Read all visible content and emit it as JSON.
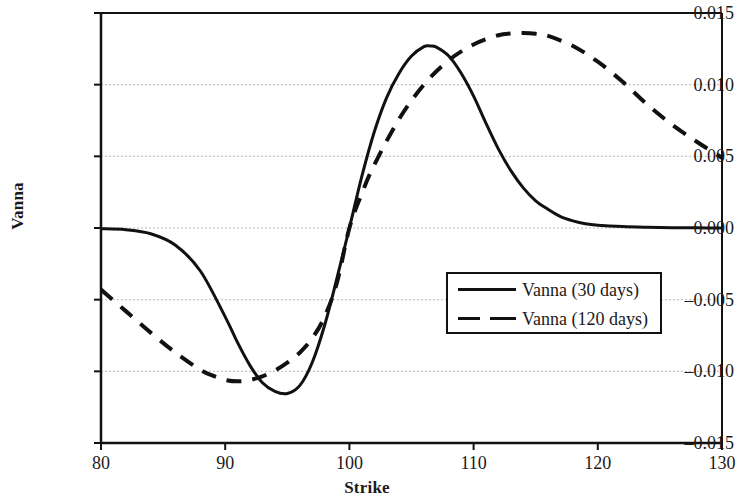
{
  "chart_data": {
    "type": "line",
    "title": "",
    "xlabel": "Strike",
    "ylabel": "Vanna",
    "xlim": [
      80,
      130
    ],
    "ylim": [
      -0.015,
      0.015
    ],
    "xticks": [
      "80",
      "90",
      "100",
      "110",
      "120",
      "130"
    ],
    "yticks": [
      "0.015",
      "0.010",
      "0.005",
      "0.000",
      "-0.005",
      "-0.010",
      "-0.015"
    ],
    "ytick_display": [
      "0.015",
      "0.010",
      "0.005",
      "0.000",
      "–0.005",
      "–0.010",
      "–0.015"
    ],
    "grid": "horizontal-dotted",
    "legend_position": "center-right",
    "series": [
      {
        "name": "Vanna (30 days)",
        "style": "solid",
        "color": "#111111",
        "x": [
          80,
          82,
          84,
          86,
          88,
          90,
          91,
          92,
          93,
          94,
          95,
          96,
          97,
          98,
          99,
          100,
          101,
          102,
          103,
          104,
          105,
          106,
          106.5,
          107,
          108,
          109,
          110,
          111,
          112,
          113,
          114,
          115,
          116,
          117,
          118,
          119,
          120,
          122,
          124,
          126,
          128,
          130
        ],
        "y": [
          -5e-05,
          -0.00012,
          -0.0004,
          -0.0012,
          -0.003,
          -0.0062,
          -0.008,
          -0.0096,
          -0.0108,
          -0.0114,
          -0.01155,
          -0.011,
          -0.0094,
          -0.0068,
          -0.0035,
          0.0,
          0.0036,
          0.0067,
          0.0091,
          0.0108,
          0.012,
          0.01265,
          0.0127,
          0.01262,
          0.012,
          0.0108,
          0.0092,
          0.0073,
          0.0055,
          0.004,
          0.0028,
          0.0019,
          0.0013,
          0.0008,
          0.0005,
          0.0003,
          0.0002,
          0.0001,
          5e-05,
          2e-05,
          1e-05,
          0.0
        ]
      },
      {
        "name": "Vanna (120 days)",
        "style": "dashed",
        "color": "#111111",
        "x": [
          80,
          82,
          84,
          86,
          88,
          89,
          90,
          91,
          92,
          93,
          94,
          95,
          96,
          97,
          98,
          99,
          100,
          101,
          102,
          104,
          106,
          108,
          110,
          112,
          113,
          114,
          115,
          116,
          118,
          120,
          122,
          124,
          126,
          128,
          130
        ],
        "y": [
          -0.0043,
          -0.0058,
          -0.0073,
          -0.0087,
          -0.0099,
          -0.0103,
          -0.0106,
          -0.0107,
          -0.0106,
          -0.01035,
          -0.00995,
          -0.0094,
          -0.0087,
          -0.0077,
          -0.0062,
          -0.0038,
          0.0,
          0.0024,
          0.0044,
          0.0076,
          0.01,
          0.0117,
          0.0128,
          0.01345,
          0.01357,
          0.0136,
          0.01355,
          0.0134,
          0.0127,
          0.0116,
          0.0102,
          0.0086,
          0.0072,
          0.006,
          0.0049
        ]
      }
    ]
  },
  "legend": {
    "entries": [
      {
        "label": "Vanna (30 days)",
        "style": "solid"
      },
      {
        "label": "Vanna (120 days)",
        "style": "dashed"
      }
    ]
  }
}
